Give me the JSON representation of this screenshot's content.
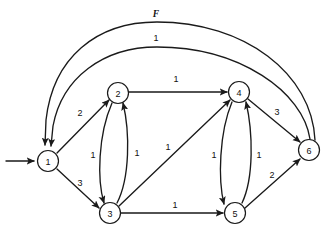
{
  "diagram": {
    "title_label": "F",
    "type": "directed-flow-network",
    "nodes": [
      {
        "id": "1",
        "label": "1",
        "cx": 48,
        "cy": 161
      },
      {
        "id": "2",
        "label": "2",
        "cx": 118,
        "cy": 93
      },
      {
        "id": "3",
        "label": "3",
        "cx": 110,
        "cy": 213
      },
      {
        "id": "4",
        "label": "4",
        "cx": 239,
        "cy": 92
      },
      {
        "id": "5",
        "label": "5",
        "cx": 235,
        "cy": 213
      },
      {
        "id": "6",
        "label": "6",
        "cx": 309,
        "cy": 150
      }
    ],
    "edges": [
      {
        "name": "edge-source-to-1",
        "from": "source",
        "to": "1",
        "label": "",
        "label_x": 0,
        "label_y": 0,
        "path": "M 6 161 L 34 161"
      },
      {
        "name": "edge-1-to-2",
        "from": "1",
        "to": "2",
        "label": "2",
        "label_x": 80,
        "label_y": 113,
        "path": "M 57 153 L 109 100"
      },
      {
        "name": "edge-1-to-3",
        "from": "1",
        "to": "3",
        "label": "3",
        "label_x": 80,
        "label_y": 183,
        "path": "M 57 169 L 99 208"
      },
      {
        "name": "edge-2-to-3",
        "from": "2",
        "to": "3",
        "label": "1",
        "label_x": 93,
        "label_y": 155,
        "path": "M 112 103 C 98 135, 97 180, 104 203"
      },
      {
        "name": "edge-3-to-2",
        "from": "3",
        "to": "2",
        "label": "1",
        "label_x": 137,
        "label_y": 153,
        "path": "M 117 203 C 130 178, 130 132, 123 103"
      },
      {
        "name": "edge-2-to-4",
        "from": "2",
        "to": "4",
        "label": "1",
        "label_x": 176,
        "label_y": 79,
        "path": "M 129 92 L 227 92"
      },
      {
        "name": "edge-3-to-4",
        "from": "3",
        "to": "4",
        "label": "1",
        "label_x": 168,
        "label_y": 147,
        "path": "M 119 206 L 230 100"
      },
      {
        "name": "edge-4-to-5",
        "from": "4",
        "to": "5",
        "label": "1",
        "label_x": 214,
        "label_y": 155,
        "path": "M 232 102 C 219 133, 218 180, 224 204"
      },
      {
        "name": "edge-5-to-4",
        "from": "5",
        "to": "4",
        "label": "1",
        "label_x": 259,
        "label_y": 155,
        "path": "M 242 203 C 254 178, 253 132, 246 102"
      },
      {
        "name": "edge-3-to-5",
        "from": "3",
        "to": "5",
        "label": "1",
        "label_x": 175,
        "label_y": 205,
        "path": "M 121 213 L 223 213"
      },
      {
        "name": "edge-4-to-6",
        "from": "4",
        "to": "6",
        "label": "3",
        "label_x": 277,
        "label_y": 112,
        "path": "M 248 99 L 300 142"
      },
      {
        "name": "edge-5-to-6",
        "from": "5",
        "to": "6",
        "label": "2",
        "label_x": 272,
        "label_y": 175,
        "path": "M 245 208 L 300 159"
      },
      {
        "name": "edge-6-to-1-outer",
        "from": "6",
        "to": "1",
        "label": "F",
        "label_x": 156,
        "label_y": 14,
        "path": "M 315 140 C 312 74, 245 22, 157 22 C 96 22, 53 58, 46 120 L 45 145"
      },
      {
        "name": "edge-6-to-1-inner",
        "from": "6",
        "to": "1",
        "label": "1",
        "label_x": 156,
        "label_y": 38,
        "path": "M 310 139 C 303 92, 240 47, 157 47 C 103 47, 62 78, 53 126 L 51 146"
      }
    ],
    "colors": {
      "stroke": "#1a1a1a",
      "node_fill": "#ffffff",
      "background": "#ffffff",
      "text": "#111111"
    }
  }
}
